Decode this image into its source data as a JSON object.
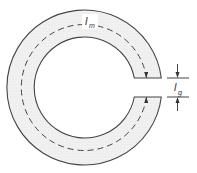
{
  "diagram": {
    "type": "magnetic-core-with-air-gap",
    "colors": {
      "stroke": "#444444",
      "core_fill": "#eeeeee",
      "background": "#ffffff"
    },
    "labels": {
      "magnetic_path_length": {
        "main": "l",
        "sub": "m"
      },
      "gap_length": {
        "main": "l",
        "sub": "g"
      }
    },
    "geometry": {
      "center": [
        90.5,
        87.5
      ],
      "outer_radius": 77.5,
      "inner_radius": 50.5,
      "mean_path_radius": 63,
      "gap_top_y": 78,
      "gap_bottom_y": 97
    }
  }
}
